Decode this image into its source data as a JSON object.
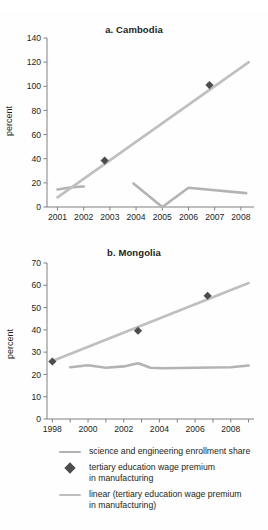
{
  "figure": {
    "background": "#fefefe",
    "cropped_caption_remnant": "",
    "series_colors": {
      "enrollment_line": "#b3b3b3",
      "trend_line": "#bfbfbf",
      "marker": "#4d4d4d",
      "axis": "#808080",
      "text": "#231f20"
    }
  },
  "legend": {
    "items": [
      {
        "marker": "line",
        "color": "#b3b3b3",
        "label": "science and engineering enrollment share"
      },
      {
        "marker": "diamond",
        "color": "#4d4d4d",
        "label": "tertiary education wage premium\nin manufacturing",
        "line1": "tertiary education wage premium",
        "line2": "in manufacturing"
      },
      {
        "marker": "line",
        "color": "#bfbfbf",
        "label": "linear (tertiary education wage premium\nin manufacturing)",
        "line1": "linear (tertiary education wage premium",
        "line2": "in manufacturing)"
      }
    ]
  },
  "chart_data": [
    {
      "id": "cambodia",
      "type": "line",
      "title": "a. Cambodia",
      "xlabel": "",
      "ylabel": "percent",
      "xlim": [
        2000.6,
        2008.5
      ],
      "ylim": [
        0,
        140
      ],
      "yticks": [
        0,
        20,
        40,
        60,
        80,
        100,
        120,
        140
      ],
      "xticks": [
        2001,
        2002,
        2003,
        2004,
        2005,
        2006,
        2007,
        2008
      ],
      "xticklabels": [
        "2001",
        "2002",
        "2003",
        "2004",
        "2005",
        "2006",
        "2007",
        "2008"
      ],
      "grid": false,
      "legend_position": "below-figure",
      "series": [
        {
          "name": "science and engineering enrollment share",
          "type": "line",
          "color": "#b3b3b3",
          "segments": [
            {
              "x": [
                2001.0,
                2001.6,
                2002.0
              ],
              "y": [
                14.5,
                16.5,
                17.0
              ]
            },
            {
              "x": [
                2003.9,
                2005.0,
                2006.0,
                2008.2
              ],
              "y": [
                19.5,
                0.0,
                16.0,
                11.5
              ]
            }
          ]
        },
        {
          "name": "linear (tertiary education wage premium in manufacturing)",
          "type": "line",
          "color": "#bfbfbf",
          "x": [
            2001.0,
            2008.3
          ],
          "y": [
            8.0,
            120.0
          ]
        },
        {
          "name": "tertiary education wage premium in manufacturing",
          "type": "scatter",
          "color": "#4d4d4d",
          "marker": "diamond",
          "x": [
            2002.8,
            2006.8
          ],
          "y": [
            38.5,
            101.0
          ]
        }
      ]
    },
    {
      "id": "mongolia",
      "type": "line",
      "title": "b. Mongolia",
      "xlabel": "",
      "ylabel": "percent",
      "xlim": [
        1997.7,
        2009.3
      ],
      "ylim": [
        0,
        70
      ],
      "yticks": [
        0,
        10,
        20,
        30,
        40,
        50,
        60,
        70
      ],
      "xticks": [
        1998,
        1999,
        2000,
        2001,
        2002,
        2003,
        2004,
        2005,
        2006,
        2007,
        2008,
        2009
      ],
      "xticklabels": [
        "1998",
        "",
        "2000",
        "",
        "2002",
        "",
        "2004",
        "",
        "2006",
        "",
        "2008",
        ""
      ],
      "grid": false,
      "legend_position": "below-figure",
      "series": [
        {
          "name": "science and engineering enrollment share",
          "type": "line",
          "color": "#b3b3b3",
          "segments": [
            {
              "x": [
                1999.0,
                2000.0,
                2001.0,
                2002.0,
                2002.8,
                2003.5,
                2004.2,
                2006.0,
                2008.0,
                2009.0
              ],
              "y": [
                23.2,
                24.1,
                23.0,
                23.6,
                25.0,
                23.0,
                22.8,
                23.0,
                23.2,
                24.0
              ]
            }
          ]
        },
        {
          "name": "linear (tertiary education wage premium in manufacturing)",
          "type": "line",
          "color": "#bfbfbf",
          "x": [
            1998.0,
            2009.0
          ],
          "y": [
            26.0,
            61.0
          ]
        },
        {
          "name": "tertiary education wage premium in manufacturing",
          "type": "scatter",
          "color": "#4d4d4d",
          "marker": "diamond",
          "x": [
            1998.0,
            2002.8,
            2006.7
          ],
          "y": [
            25.8,
            39.6,
            55.3
          ]
        }
      ]
    }
  ]
}
